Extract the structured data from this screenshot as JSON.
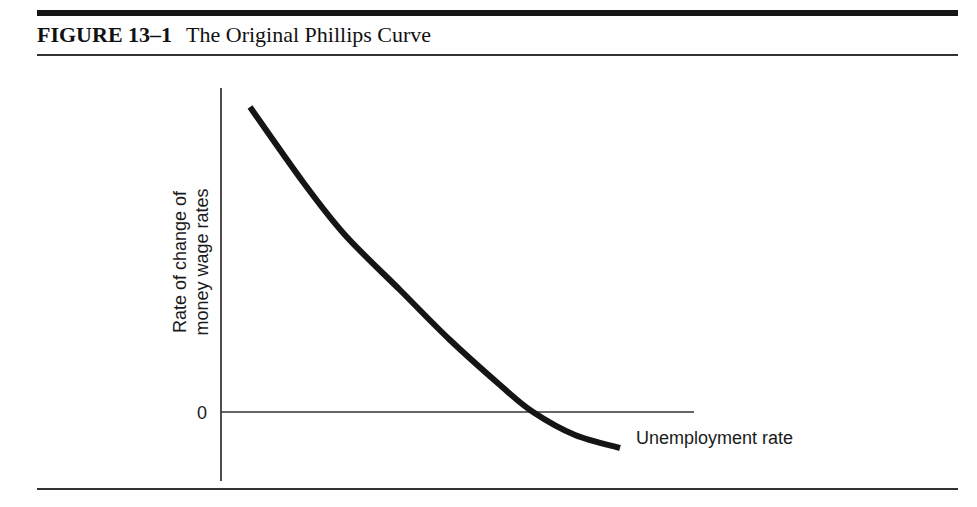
{
  "figure": {
    "number": "FIGURE 13–1",
    "title": "The Original Phillips Curve"
  },
  "colors": {
    "ink": "#151515",
    "background": "#ffffff"
  },
  "chart_data": {
    "type": "line",
    "title": "The Original Phillips Curve",
    "xlabel": "Unemployment rate",
    "ylabel_lines": [
      "Rate of change of",
      "money wage rates"
    ],
    "ylabel": "Rate of change of money wage rates",
    "y_ticks": [
      {
        "value": 0,
        "label": "0"
      }
    ],
    "x_ticks": [],
    "grid": false,
    "legend": null,
    "series": [
      {
        "name": "Phillips curve",
        "description": "Downward-sloping convex curve; wage inflation falls as unemployment rises, crossing zero and becoming negative at high unemployment",
        "points_px": [
          [
            250,
            107
          ],
          [
            303,
            182
          ],
          [
            345,
            235
          ],
          [
            400,
            290
          ],
          [
            450,
            340
          ],
          [
            500,
            385
          ],
          [
            533,
            412
          ],
          [
            575,
            435
          ],
          [
            620,
            448
          ]
        ],
        "points_normalized": [
          {
            "x": 0.07,
            "y": 1.0
          },
          {
            "x": 0.2,
            "y": 0.75
          },
          {
            "x": 0.3,
            "y": 0.58
          },
          {
            "x": 0.44,
            "y": 0.4
          },
          {
            "x": 0.56,
            "y": 0.24
          },
          {
            "x": 0.69,
            "y": 0.09
          },
          {
            "x": 0.77,
            "y": 0.0
          },
          {
            "x": 0.87,
            "y": -0.08
          },
          {
            "x": 0.98,
            "y": -0.12
          }
        ]
      }
    ],
    "annotations": []
  }
}
